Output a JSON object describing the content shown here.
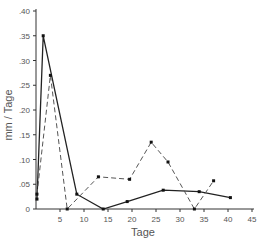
{
  "chart_data": {
    "type": "line",
    "title": "",
    "xlabel": "Tage",
    "ylabel": "mm / Tage",
    "xlim": [
      0,
      45
    ],
    "ylim": [
      0,
      0.4
    ],
    "grid": false,
    "legend": null,
    "x_ticks": [
      5,
      10,
      15,
      20,
      25,
      30,
      35,
      40,
      45
    ],
    "x_tick_labels": [
      "5",
      "10",
      "15",
      "20",
      "25",
      "30",
      "35",
      "40",
      "45"
    ],
    "y_ticks": [
      0,
      0.05,
      0.1,
      0.15,
      0.2,
      0.25,
      0.3,
      0.35,
      0.4
    ],
    "y_tick_labels": [
      "0",
      ".05",
      ".10",
      ".15",
      ".20",
      ".25",
      ".30",
      ".35",
      ".40"
    ],
    "series": [
      {
        "name": "solid",
        "style": "solid",
        "color": "#222222",
        "x": [
          0.2,
          1.5,
          8.5,
          14,
          19,
          26.5,
          34,
          40.5
        ],
        "y": [
          0.02,
          0.35,
          0.03,
          0.0,
          0.015,
          0.038,
          0.035,
          0.023
        ]
      },
      {
        "name": "dashed",
        "style": "dashed",
        "color": "#555555",
        "x": [
          0.2,
          3,
          6.5,
          13,
          19.5,
          24,
          27.5,
          33,
          37
        ],
        "y": [
          0.03,
          0.27,
          0.0,
          0.065,
          0.06,
          0.135,
          0.095,
          0.0,
          0.057
        ]
      }
    ]
  }
}
